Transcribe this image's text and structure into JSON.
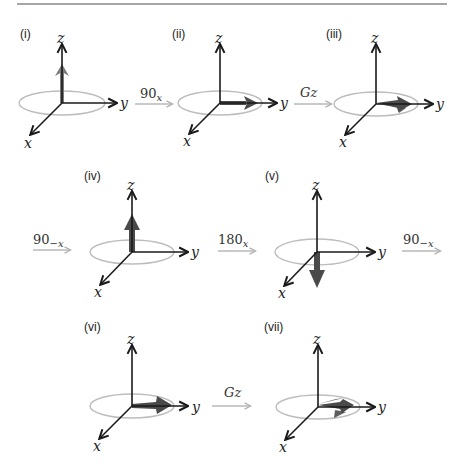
{
  "figure": {
    "colors": {
      "axis": "#1a1a1a",
      "ellipse": "#bdbdbd",
      "pulse_arrow": "#b8b8b8",
      "magnetization": "#4a4a4a",
      "rule": "#8a8a8a"
    },
    "axis_labels": {
      "x": "x",
      "y": "y",
      "z": "z"
    },
    "panels": [
      {
        "id": "i",
        "label": "(i)",
        "magnetization": "up (+z), small"
      },
      {
        "id": "ii",
        "label": "(ii)",
        "magnetization": "along +y"
      },
      {
        "id": "iii",
        "label": "(iii)",
        "magnetization": "along +y, dephasing (fanned)"
      },
      {
        "id": "iv",
        "label": "(iv)",
        "magnetization": "up (+z)"
      },
      {
        "id": "v",
        "label": "(v)",
        "magnetization": "down (-z)"
      },
      {
        "id": "vi",
        "label": "(vi)",
        "magnetization": "along +y"
      },
      {
        "id": "vii",
        "label": "(vii)",
        "magnetization": "along +y, dephasing (fanned)"
      }
    ],
    "pulses": [
      {
        "id": "p1",
        "base": "90",
        "sub": "x",
        "between": [
          "i",
          "ii"
        ]
      },
      {
        "id": "p2",
        "base": "Gz",
        "sub": "",
        "between": [
          "ii",
          "iii"
        ]
      },
      {
        "id": "p3",
        "base": "90",
        "sub": "−x",
        "between": [
          "iii",
          "iv"
        ]
      },
      {
        "id": "p4",
        "base": "180",
        "sub": "x",
        "between": [
          "iv",
          "v"
        ]
      },
      {
        "id": "p5",
        "base": "90",
        "sub": "−x",
        "between": [
          "v",
          "vi"
        ]
      },
      {
        "id": "p6",
        "base": "Gz",
        "sub": "",
        "between": [
          "vi",
          "vii"
        ]
      }
    ]
  }
}
